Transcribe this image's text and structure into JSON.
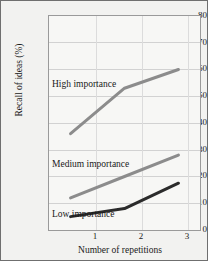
{
  "chart_data": {
    "type": "line",
    "title": "",
    "xlabel": "Number of repetitions",
    "ylabel": "Recall of ideas (%)",
    "categories": [
      "1",
      "2",
      "3"
    ],
    "x": [
      1,
      2,
      3
    ],
    "xlim": [
      0.6,
      3.4
    ],
    "ylim": [
      0,
      80
    ],
    "yticks": [
      0,
      10,
      20,
      30,
      40,
      50,
      60,
      70,
      80
    ],
    "xticks": [
      "1",
      "2",
      "3"
    ],
    "grid": "horizontal",
    "legend_position": "inline-annotations",
    "series": [
      {
        "name": "High importance",
        "values": [
          36,
          53,
          60
        ],
        "color": "#8c8c8c",
        "annotation": "High importance"
      },
      {
        "name": "Medium importance",
        "values": [
          12,
          20,
          28
        ],
        "color": "#8c8c8c",
        "annotation": "Medium importance"
      },
      {
        "name": "Low importance",
        "values": [
          5,
          8,
          17.5
        ],
        "color": "#2b2b2b",
        "annotation": "Low importance"
      }
    ]
  },
  "axes": {
    "y_tick_labels": [
      "80",
      "70",
      "60",
      "50",
      "40",
      "30",
      "20",
      "10",
      "0"
    ],
    "x_tick_labels": [
      "1",
      "2",
      "3"
    ],
    "y_axis_title": "Recall of ideas (%)",
    "x_axis_title": "Number of repetitions"
  },
  "annotations": {
    "high": "High importance",
    "medium": "Medium importance",
    "low": "Low importance"
  },
  "colors": {
    "background": "#d9d9d6",
    "figure": "#f2f2f0",
    "plot": "#f7f7f5",
    "grid": "#d2d2d2",
    "frame": "#9a9a9a",
    "gray_series": "#8c8c8c",
    "dark_series": "#2b2b2b",
    "text": "#1a1a1a"
  }
}
